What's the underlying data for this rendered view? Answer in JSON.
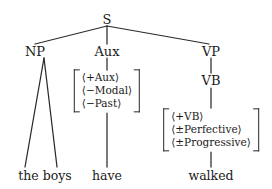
{
  "diagram": {
    "type": "syntax-tree",
    "title": "",
    "background_color": "#ffffff",
    "line_color": "#2a2a2a",
    "text_color": "#1a1a1a",
    "nodes": {
      "root": "S",
      "np": "NP",
      "aux": "Aux",
      "vp": "VP",
      "vb": "VB"
    },
    "terminals": {
      "np_words": "the boys",
      "aux_word": "have",
      "vb_word": "walked"
    },
    "aux_matrix": {
      "rows": [
        "⟨+Aux⟩",
        "⟨−Modal⟩",
        "⟨−Past⟩"
      ]
    },
    "vb_matrix": {
      "rows": [
        "⟨+VB⟩",
        "⟨±Perfective⟩",
        "⟨±Progressive⟩"
      ]
    }
  }
}
